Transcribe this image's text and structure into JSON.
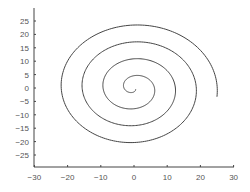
{
  "chart_data": {
    "type": "line",
    "title": "",
    "xlabel": "",
    "ylabel": "",
    "xlim": [
      -30,
      30
    ],
    "ylim": [
      -30,
      30
    ],
    "xticks": [
      -30,
      -20,
      -10,
      0,
      10,
      20,
      30
    ],
    "yticks": [
      25,
      20,
      15,
      10,
      5,
      0,
      -5,
      -10,
      -15,
      -20,
      -25
    ],
    "grid": false,
    "legend": null,
    "series": [
      {
        "name": "Archimedean spiral",
        "equation": "r = a*theta, approx 4 turns, outer radius ~25",
        "color": "#444444",
        "start": [
          0.5,
          0.5
        ],
        "end": [
          25,
          -3
        ]
      }
    ]
  }
}
